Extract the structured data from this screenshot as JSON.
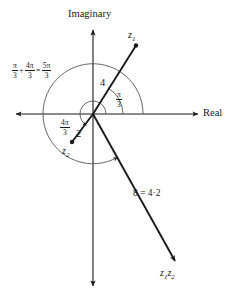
{
  "figure": {
    "type": "argand-diagram",
    "axes": {
      "imaginary_label": "Imaginary",
      "real_label": "Real"
    },
    "points": [
      {
        "name": "z1",
        "base": "z",
        "sub": "1"
      },
      {
        "name": "z2",
        "base": "z",
        "sub": "2"
      },
      {
        "name": "z1z2",
        "base": "z",
        "sub": "1"
      }
    ],
    "labels": {
      "z1": {
        "base": "z",
        "sub": "1"
      },
      "z2": {
        "base": "z",
        "sub": "2"
      },
      "product": {
        "base1": "z",
        "sub1": "1",
        "base2": "z",
        "sub2": "2"
      },
      "modulus_z1": "4",
      "modulus_z2": "2",
      "modulus_product": "8 = 4·2",
      "angle_z1": {
        "num": "π",
        "den": "3"
      },
      "angle_z2": {
        "num": "4π",
        "den": "3"
      },
      "angle_sum": {
        "term1": {
          "num": "π",
          "den": "3"
        },
        "plus": "+",
        "term2": {
          "num": "4π",
          "den": "3"
        },
        "equals": "=",
        "result": {
          "num": "5π",
          "den": "3"
        }
      }
    },
    "colors": {
      "stroke": "#1a1a1a",
      "arc": "#4d4d4d",
      "background": "#ffffff"
    },
    "geometry": {
      "origin_x": 93,
      "origin_y": 114,
      "z1_x": 136,
      "z1_y": 45,
      "z2_x": 72,
      "z2_y": 142,
      "product_x": 176,
      "product_y": 263
    }
  }
}
